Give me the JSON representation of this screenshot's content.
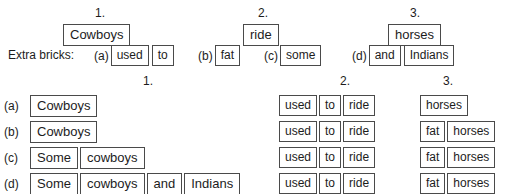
{
  "top": {
    "column_numbers": [
      "1.",
      "2.",
      "3."
    ],
    "model_bricks": [
      "Cowboys",
      "ride",
      "horses"
    ]
  },
  "extra": {
    "label": "Extra bricks:",
    "groups": [
      {
        "tag": "(a)",
        "bricks": [
          "used",
          "to"
        ]
      },
      {
        "tag": "(b)",
        "bricks": [
          "fat"
        ]
      },
      {
        "tag": "(c)",
        "bricks": [
          "some"
        ]
      },
      {
        "tag": "(d)",
        "bricks": [
          "and",
          "Indians"
        ]
      }
    ]
  },
  "table": {
    "column_numbers": [
      "1.",
      "2.",
      "3."
    ],
    "rows": [
      {
        "tag": "(a)",
        "col1": [
          "Cowboys"
        ],
        "col2": [
          "used",
          "to",
          "ride"
        ],
        "col3": [
          "horses"
        ]
      },
      {
        "tag": "(b)",
        "col1": [
          "Cowboys"
        ],
        "col2": [
          "used",
          "to",
          "ride"
        ],
        "col3": [
          "fat",
          "horses"
        ]
      },
      {
        "tag": "(c)",
        "col1": [
          "Some",
          "cowboys"
        ],
        "col2": [
          "used",
          "to",
          "ride"
        ],
        "col3": [
          "fat",
          "horses"
        ]
      },
      {
        "tag": "(d)",
        "col1": [
          "Some",
          "cowboys",
          "and",
          "Indians"
        ],
        "col2": [
          "used",
          "to",
          "ride"
        ],
        "col3": [
          "fat",
          "horses"
        ]
      }
    ]
  },
  "colors": {
    "background": "#ffffff",
    "text": "#1c1c1c",
    "border": "#4a4a4a"
  }
}
